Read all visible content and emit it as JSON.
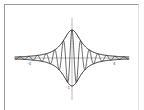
{
  "chart_data": {
    "type": "line",
    "title": "",
    "xlabel": "",
    "ylabel": "",
    "xlim": [
      -5,
      5
    ],
    "ylim": [
      -1,
      1
    ],
    "grid": false,
    "legend": null,
    "tick_labels": {
      "x_left": "-4",
      "x_right": "4",
      "y_bottom": "-1"
    },
    "series": [
      {
        "name": "upper envelope",
        "formula": "1/(1+x^2)",
        "style": "solid"
      },
      {
        "name": "lower envelope",
        "formula": "-1/(1+x^2)",
        "style": "solid"
      },
      {
        "name": "oscillation",
        "formula": "cos(8x)/(1+x^2)",
        "style": "solid"
      }
    ]
  },
  "colors": {
    "curve": "#2a2a2a",
    "axis": "#8a8a8a",
    "frame": "#9a9a9a"
  }
}
